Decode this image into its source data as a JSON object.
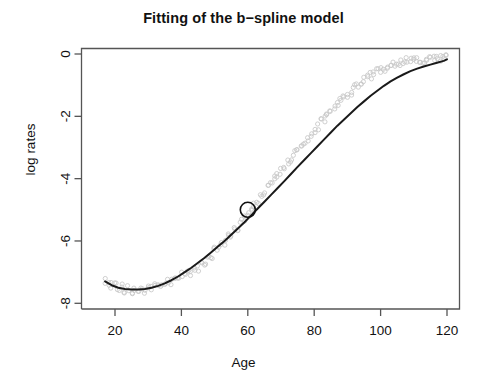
{
  "chart_data": {
    "type": "scatter",
    "title": "Fitting of the b−spline model",
    "xlabel": "Age",
    "ylabel": "log rates",
    "grid": false,
    "legend": null,
    "xlim": [
      16,
      122
    ],
    "ylim": [
      -8.1,
      0.3
    ],
    "xticks": [
      20,
      40,
      60,
      80,
      100,
      120
    ],
    "yticks": [
      0,
      -2,
      -4,
      -6,
      -8
    ],
    "xtick_labels": [
      "20",
      "40",
      "60",
      "80",
      "100",
      "120"
    ],
    "ytick_labels": [
      "0",
      "-2",
      "-4",
      "-6",
      "-8"
    ],
    "series": [
      {
        "name": "observed log rates",
        "type": "scatter",
        "marker": "open-circle",
        "color": "#c9c9c9",
        "x": [
          17,
          18,
          19,
          20,
          21,
          22,
          23,
          24,
          25,
          26,
          27,
          28,
          29,
          30,
          31,
          32,
          33,
          34,
          35,
          36,
          37,
          38,
          39,
          40,
          41,
          42,
          43,
          44,
          45,
          46,
          47,
          48,
          49,
          50,
          51,
          52,
          53,
          54,
          55,
          56,
          57,
          58,
          59,
          60,
          61,
          62,
          63,
          64,
          65,
          66,
          67,
          68,
          69,
          70,
          71,
          72,
          73,
          74,
          75,
          76,
          77,
          78,
          79,
          80,
          81,
          82,
          83,
          84,
          85,
          86,
          87,
          88,
          89,
          90,
          91,
          92,
          93,
          94,
          95,
          96,
          97,
          98,
          99,
          100,
          101,
          102,
          103,
          104,
          105,
          106,
          107,
          108,
          109,
          110,
          111,
          112,
          113,
          114,
          115,
          116,
          117,
          118,
          119,
          120
        ],
        "y": [
          -7.25,
          -7.33,
          -7.4,
          -7.45,
          -7.52,
          -7.48,
          -7.58,
          -7.54,
          -7.62,
          -7.55,
          -7.66,
          -7.52,
          -7.6,
          -7.48,
          -7.55,
          -7.42,
          -7.5,
          -7.38,
          -7.42,
          -7.3,
          -7.34,
          -7.2,
          -7.24,
          -7.1,
          -7.12,
          -6.98,
          -7.0,
          -6.85,
          -6.86,
          -6.7,
          -6.68,
          -6.5,
          -6.48,
          -6.3,
          -6.26,
          -6.1,
          -6.04,
          -5.86,
          -5.8,
          -5.62,
          -5.56,
          -5.38,
          -5.3,
          -5.1,
          -5.05,
          -4.85,
          -4.78,
          -4.58,
          -4.5,
          -4.3,
          -4.22,
          -4.02,
          -3.95,
          -3.75,
          -3.68,
          -3.48,
          -3.4,
          -3.2,
          -3.12,
          -2.94,
          -2.86,
          -2.68,
          -2.6,
          -2.42,
          -2.35,
          -2.18,
          -2.1,
          -1.94,
          -1.86,
          -1.7,
          -1.64,
          -1.48,
          -1.42,
          -1.28,
          -1.22,
          -1.08,
          -1.03,
          -0.9,
          -0.85,
          -0.74,
          -0.7,
          -0.6,
          -0.56,
          -0.48,
          -0.45,
          -0.38,
          -0.36,
          -0.31,
          -0.29,
          -0.26,
          -0.25,
          -0.22,
          -0.22,
          -0.2,
          -0.2,
          -0.19,
          -0.19,
          -0.18,
          -0.18,
          -0.17,
          -0.16,
          -0.15,
          -0.14,
          -0.13
        ]
      },
      {
        "name": "b-spline fit",
        "type": "line",
        "color": "#1a1a1a",
        "x": [
          17,
          19,
          21,
          23,
          25,
          27,
          29,
          31,
          33,
          35,
          37,
          39,
          41,
          43,
          45,
          47,
          49,
          51,
          53,
          55,
          57,
          59,
          61,
          63,
          65,
          67,
          69,
          71,
          73,
          75,
          77,
          79,
          81,
          83,
          85,
          87,
          89,
          91,
          93,
          95,
          97,
          99,
          101,
          103,
          105,
          107,
          109,
          111,
          113,
          115,
          117,
          119,
          120
        ],
        "y": [
          -7.3,
          -7.42,
          -7.5,
          -7.54,
          -7.56,
          -7.56,
          -7.54,
          -7.5,
          -7.44,
          -7.36,
          -7.26,
          -7.14,
          -7.0,
          -6.86,
          -6.7,
          -6.54,
          -6.36,
          -6.18,
          -6.0,
          -5.8,
          -5.6,
          -5.4,
          -5.18,
          -4.96,
          -4.74,
          -4.52,
          -4.3,
          -4.08,
          -3.85,
          -3.62,
          -3.4,
          -3.18,
          -2.96,
          -2.74,
          -2.52,
          -2.3,
          -2.1,
          -1.9,
          -1.7,
          -1.52,
          -1.34,
          -1.18,
          -1.02,
          -0.88,
          -0.76,
          -0.65,
          -0.55,
          -0.47,
          -0.4,
          -0.34,
          -0.28,
          -0.22,
          -0.17
        ]
      }
    ],
    "annotations": [
      {
        "name": "highlight-point",
        "marker": "open-circle-large",
        "x": 60,
        "y": -5.0,
        "color": "#111111"
      }
    ]
  }
}
